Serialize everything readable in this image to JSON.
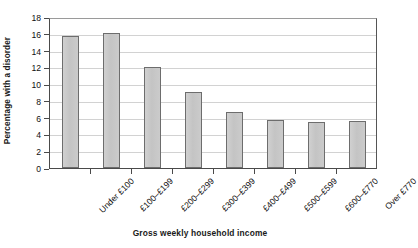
{
  "chart_data": {
    "type": "bar",
    "title": "",
    "xlabel": "Gross weekly household income",
    "ylabel": "Percentage with a disorder",
    "categories": [
      "Under £100",
      "£100–£199",
      "£200–£299",
      "£300–£399",
      "£400–£499",
      "£500–£599",
      "£600–£770",
      "Over £770"
    ],
    "values": [
      15.7,
      16.1,
      12.0,
      9.1,
      6.7,
      5.7,
      5.45,
      5.65
    ],
    "ylim": [
      0,
      18
    ],
    "ytick_step": 2,
    "ytick_labels": [
      "0",
      "2",
      "4",
      "6",
      "8",
      "10",
      "12",
      "14",
      "16",
      "18"
    ],
    "grid": "horizontal",
    "legend": "none",
    "bar_color": "#c6c6c6",
    "bar_border_color": "#6d6d6d",
    "grid_color": "#d2d2d2",
    "axis_color": "#4a4a4a"
  }
}
